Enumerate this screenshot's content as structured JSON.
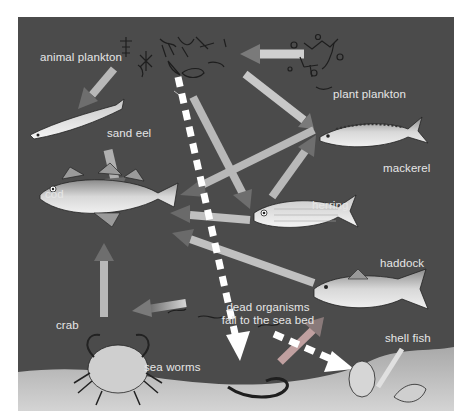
{
  "diagram": {
    "colors": {
      "water": "#4b4b4b",
      "seabed": "#bdbdbd",
      "arrow_light": "#d8d8d8",
      "arrow_dark": "#6a6a6a",
      "dashed_arrow": "#ffffff",
      "label": "#e6e6e6"
    },
    "labels": {
      "animal_plankton": "animal plankton",
      "plant_plankton": "plant plankton",
      "sand_eel": "sand eel",
      "cod": "cod",
      "mackerel": "mackerel",
      "herring": "herring",
      "haddock": "haddock",
      "dead_organisms_line1": "dead organisms",
      "dead_organisms_line2": "fall to the sea bed",
      "crab": "crab",
      "sea_worms": "sea worms",
      "shell_fish": "shell fish"
    },
    "nodes": [
      {
        "id": "plant_plankton",
        "label": "plant plankton",
        "icon": "plant-plankton-icon"
      },
      {
        "id": "animal_plankton",
        "label": "animal plankton",
        "icon": "animal-plankton-icon"
      },
      {
        "id": "sand_eel",
        "label": "sand eel",
        "icon": "sand-eel-icon"
      },
      {
        "id": "cod",
        "label": "cod",
        "icon": "cod-icon"
      },
      {
        "id": "mackerel",
        "label": "mackerel",
        "icon": "mackerel-icon"
      },
      {
        "id": "herring",
        "label": "herring",
        "icon": "herring-icon"
      },
      {
        "id": "haddock",
        "label": "haddock",
        "icon": "haddock-icon"
      },
      {
        "id": "crab",
        "label": "crab",
        "icon": "crab-icon"
      },
      {
        "id": "sea_worms",
        "label": "sea worms",
        "icon": "sea-worm-icon"
      },
      {
        "id": "shell_fish",
        "label": "shell fish",
        "icon": "shell-fish-icon"
      }
    ],
    "edges": [
      {
        "from": "plant_plankton",
        "to": "animal_plankton",
        "style": "solid"
      },
      {
        "from": "plant_plankton",
        "to": "mackerel",
        "style": "solid"
      },
      {
        "from": "animal_plankton",
        "to": "sand_eel",
        "style": "solid"
      },
      {
        "from": "animal_plankton",
        "to": "herring",
        "style": "solid"
      },
      {
        "from": "animal_plankton",
        "to": "mackerel",
        "style": "solid"
      },
      {
        "from": "sand_eel",
        "to": "cod",
        "style": "solid"
      },
      {
        "from": "mackerel",
        "to": "cod",
        "style": "solid"
      },
      {
        "from": "herring",
        "to": "cod",
        "style": "solid"
      },
      {
        "from": "herring",
        "to": "mackerel",
        "style": "solid"
      },
      {
        "from": "haddock",
        "to": "cod",
        "style": "solid"
      },
      {
        "from": "crab",
        "to": "cod",
        "style": "solid"
      },
      {
        "from": "sea_worms",
        "to": "crab",
        "style": "solid"
      },
      {
        "from": "shell_fish",
        "to": "haddock",
        "style": "solid"
      },
      {
        "from": "animal_plankton",
        "to": "sea_worms",
        "style": "dashed",
        "note": "dead organisms fall to the sea bed"
      },
      {
        "from": "dead_organisms",
        "to": "shell_fish",
        "style": "dashed"
      }
    ]
  }
}
